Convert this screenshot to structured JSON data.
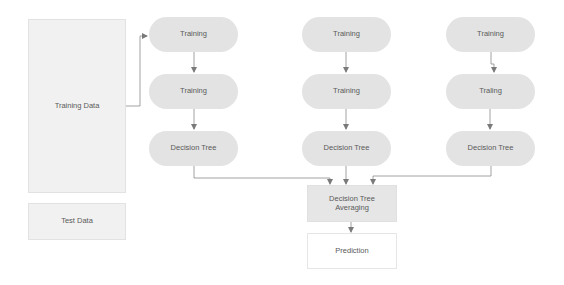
{
  "diagram": {
    "type": "random-forest-flowchart",
    "inputs": {
      "training_data": "Training Data",
      "test_data": "Test Data"
    },
    "columns": [
      {
        "nodes": [
          "Training",
          "Training",
          "Decision Tree"
        ]
      },
      {
        "nodes": [
          "Training",
          "Training",
          "Decision Tree"
        ]
      },
      {
        "nodes": [
          "Training",
          "Traling",
          "Decision Tree"
        ]
      }
    ],
    "aggregator": {
      "line1": "Decision Tree",
      "line2": "Averaging"
    },
    "output": "Prediction",
    "colors": {
      "node_fill": "#e3e3e3",
      "input_fill": "#f1f1f1",
      "connector": "#8a8a8a",
      "text": "#5a5a5a"
    }
  }
}
